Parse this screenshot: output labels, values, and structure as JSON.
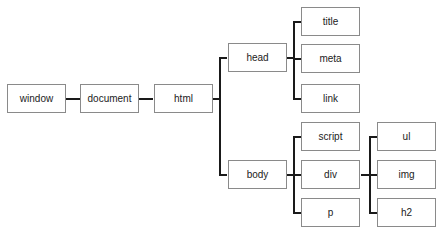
{
  "diagram": {
    "type": "tree",
    "nodes": {
      "window": "window",
      "document": "document",
      "html": "html",
      "head": "head",
      "body": "body",
      "title": "title",
      "meta": "meta",
      "link": "link",
      "script": "script",
      "div": "div",
      "p": "p",
      "ul": "ul",
      "img": "img",
      "h2": "h2"
    },
    "edges": [
      [
        "window",
        "document"
      ],
      [
        "document",
        "html"
      ],
      [
        "html",
        "head"
      ],
      [
        "html",
        "body"
      ],
      [
        "head",
        "title"
      ],
      [
        "head",
        "meta"
      ],
      [
        "head",
        "link"
      ],
      [
        "body",
        "script"
      ],
      [
        "body",
        "div"
      ],
      [
        "body",
        "p"
      ],
      [
        "div",
        "ul"
      ],
      [
        "div",
        "img"
      ],
      [
        "div",
        "h2"
      ]
    ]
  },
  "colors": {
    "border": "#8a8a8a",
    "line": "#1a1a1a",
    "text": "#222222"
  }
}
